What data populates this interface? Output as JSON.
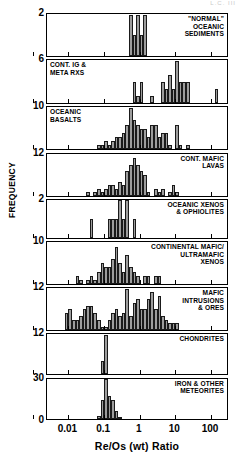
{
  "figure": {
    "corner_note": "L.C. III",
    "y_axis_label": "FREQUENCY",
    "x_axis_title": "Re/Os (wt) Ratio"
  },
  "chart_data": {
    "type": "bar",
    "title": "",
    "xlabel": "Re/Os (wt) Ratio",
    "ylabel": "FREQUENCY",
    "x_scale": "log",
    "xlim": [
      0.0025,
      320
    ],
    "x_tick_labels": [
      "0.01",
      "0.1",
      "1",
      "10",
      "100"
    ],
    "x_tick_values": [
      0.01,
      0.1,
      1,
      10,
      100
    ],
    "grid": false,
    "legend": "none",
    "bin_width_decades": 0.1,
    "panels": [
      {
        "name": "normal-oceanic-sediments",
        "label": "\"NORMAL\"\nOCEANIC\nSEDIMENTS",
        "label_side": "right",
        "ymax": 2,
        "ymax_label": "2",
        "bins_log10": [
          -0.3,
          -0.2,
          -0.1,
          0.0,
          0.1
        ],
        "values": [
          2,
          1,
          2,
          1,
          2
        ]
      },
      {
        "name": "continental-igneous-meta-rocks",
        "label": "CONT. IG &\nMETA RXS",
        "label_side": "left",
        "ymax": 6,
        "ymax_label": "6",
        "bins_log10": [
          -0.3,
          -0.2,
          -0.1,
          0.0,
          0.3,
          0.6,
          0.7,
          0.8,
          0.9,
          1.0,
          1.1,
          1.2,
          1.3,
          1.4,
          2.1
        ],
        "values": [
          0,
          3,
          1,
          3,
          1,
          3,
          2,
          4,
          2,
          6,
          3,
          3,
          3,
          0,
          2
        ]
      },
      {
        "name": "oceanic-basalts",
        "label": "OCEANIC\nBASALTS",
        "label_side": "left",
        "ymax": 10,
        "ymax_label": "10",
        "bins_log10": [
          -1.3,
          -1.2,
          -1.1,
          -1.0,
          -0.9,
          -0.8,
          -0.7,
          -0.6,
          -0.5,
          -0.4,
          -0.3,
          -0.2,
          -0.1,
          0.0,
          0.1,
          0.2,
          0.3,
          0.4,
          0.5,
          0.6,
          0.7,
          0.8,
          1.0,
          1.1,
          1.3
        ],
        "values": [
          0,
          1,
          1,
          2,
          1,
          2,
          3,
          3,
          4,
          6,
          10,
          7,
          6,
          5,
          5,
          3,
          6,
          6,
          3,
          4,
          4,
          1,
          6,
          1,
          1
        ]
      },
      {
        "name": "continental-mafic-lavas",
        "label": "CONT. MAFIC\nLAVAS",
        "label_side": "right",
        "ymax": 12,
        "ymax_label": "12",
        "bins_log10": [
          -1.5,
          -1.4,
          -1.3,
          -1.2,
          -1.1,
          -1.0,
          -0.9,
          -0.8,
          -0.7,
          -0.6,
          -0.5,
          -0.4,
          -0.3,
          -0.2,
          -0.1,
          0.0,
          0.1,
          0.2,
          0.4,
          0.5,
          0.6,
          0.8,
          0.9,
          1.0
        ],
        "values": [
          1,
          0,
          1,
          2,
          1,
          2,
          3,
          3,
          2,
          4,
          3,
          7,
          9,
          11,
          9,
          7,
          6,
          1,
          2,
          1,
          2,
          1,
          3,
          1
        ]
      },
      {
        "name": "oceanic-xenos-ophiolites",
        "label": "OCEANIC XENOS\n& OPHIOLITES",
        "label_side": "right",
        "ymax": 2,
        "ymax_label": "2",
        "bins_log10": [
          -1.4,
          -1.0,
          -0.9,
          -0.8,
          -0.7,
          -0.6,
          -0.5,
          -0.4,
          -0.3,
          -0.2
        ],
        "values": [
          1,
          0,
          1,
          1,
          1,
          2,
          1,
          2,
          0,
          1
        ]
      },
      {
        "name": "continental-mafic-ultramafic-xenos",
        "label": "CONTINENTAL MAFIC/\nULTRAMAFIC\nXENOS",
        "label_side": "right",
        "ymax": 10,
        "ymax_label": "10",
        "bins_log10": [
          -1.8,
          -1.7,
          -1.5,
          -1.4,
          -1.3,
          -1.2,
          -1.1,
          -1.0,
          -0.9,
          -0.8,
          -0.7,
          -0.6,
          -0.5,
          -0.4,
          -0.3,
          -0.2,
          -0.1,
          0.1,
          0.2,
          0.4,
          0.5
        ],
        "values": [
          2,
          1,
          1,
          2,
          1,
          3,
          5,
          4,
          4,
          6,
          9,
          5,
          3,
          7,
          4,
          3,
          2,
          2,
          2,
          2,
          2
        ]
      },
      {
        "name": "mafic-intrusions-ores",
        "label": "MAFIC\nINTRUSIONS\n& ORES",
        "label_side": "right",
        "ymax": 12,
        "ymax_label": "12",
        "bins_log10": [
          -2.1,
          -2.0,
          -1.9,
          -1.8,
          -1.7,
          -1.6,
          -1.5,
          -1.4,
          -1.3,
          -1.2,
          -1.1,
          -1.0,
          -0.9,
          -0.8,
          -0.7,
          -0.6,
          -0.5,
          -0.4,
          -0.3,
          -0.2,
          -0.1,
          0.0,
          0.1,
          0.2,
          0.3,
          0.4,
          0.5,
          0.6,
          0.7,
          0.8,
          0.9,
          1.0
        ],
        "values": [
          5,
          6,
          3,
          3,
          4,
          6,
          7,
          7,
          5,
          3,
          1,
          1,
          3,
          5,
          6,
          4,
          5,
          12,
          4,
          8,
          9,
          6,
          6,
          9,
          11,
          6,
          10,
          4,
          3,
          2,
          2,
          2
        ]
      },
      {
        "name": "chondrites",
        "label": "CHONDRITES",
        "label_side": "right",
        "ymax": 12,
        "ymax_label": "12",
        "bins_log10": [
          -1.1,
          -1.0
        ],
        "values": [
          4,
          12
        ]
      },
      {
        "name": "iron-other-meteorites",
        "label": "IRON & OTHER\nMETEORITES",
        "label_side": "right",
        "ymax": 30,
        "ymax_label": "30",
        "ymin_label": "0",
        "bins_log10": [
          -1.2,
          -1.1,
          -1.0,
          -0.9,
          -0.8,
          -0.7,
          -0.6
        ],
        "values": [
          2,
          14,
          30,
          17,
          14,
          6,
          1
        ]
      }
    ]
  }
}
